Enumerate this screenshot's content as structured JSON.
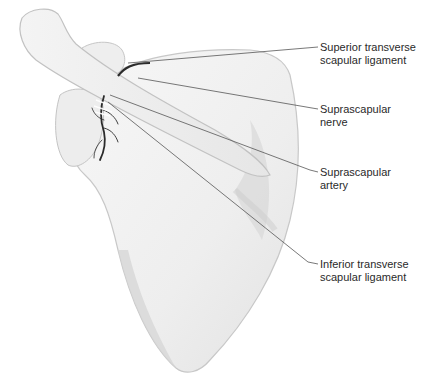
{
  "figure": {
    "colors": {
      "background": "#ffffff",
      "bone_fill": "#f2f2f2",
      "bone_shadow": "#cfcfcf",
      "bone_outline": "#bdbdbd",
      "nerve_artery": "#2b2b2b",
      "leader_line": "#555555",
      "label_text": "#2a2a2a"
    }
  },
  "labels": [
    {
      "id": "superior-transverse-scapular-ligament",
      "line1": "Superior transverse",
      "line2": "scapular ligament",
      "x": 320,
      "y": 41,
      "target": [
        128,
        63
      ],
      "elbow": [
        318,
        47
      ]
    },
    {
      "id": "suprascapular-nerve",
      "line1": "Suprascapular",
      "line2": "nerve",
      "x": 320,
      "y": 103,
      "target": [
        138,
        78
      ],
      "elbow": [
        318,
        109
      ]
    },
    {
      "id": "suprascapular-artery",
      "line1": "Suprascapular",
      "line2": "artery",
      "x": 320,
      "y": 166,
      "target": [
        110,
        95
      ],
      "elbow": [
        318,
        172
      ]
    },
    {
      "id": "inferior-transverse-scapular-ligament",
      "line1": "Inferior transverse",
      "line2": "scapular ligament",
      "x": 320,
      "y": 258,
      "target": [
        108,
        102
      ],
      "elbow": [
        318,
        264
      ]
    }
  ]
}
